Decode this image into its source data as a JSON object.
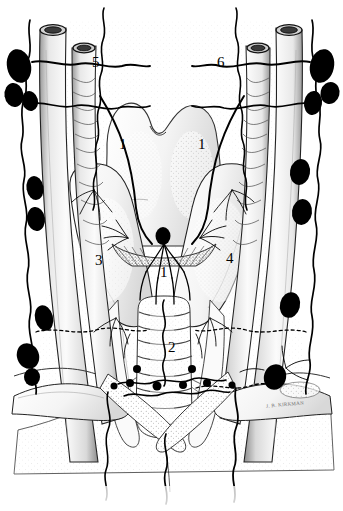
{
  "figure": {
    "width": 343,
    "height": 511,
    "background": "#ffffff",
    "ink": "#000000",
    "style": "black-and-white stipple line drawing"
  },
  "labels": [
    {
      "id": "label-1-left",
      "text": "1",
      "x": 119,
      "y": 137
    },
    {
      "id": "label-1-right",
      "text": "1",
      "x": 198,
      "y": 137
    },
    {
      "id": "label-5",
      "text": "5",
      "x": 92,
      "y": 55
    },
    {
      "id": "label-6",
      "text": "6",
      "x": 217,
      "y": 55
    },
    {
      "id": "label-3",
      "text": "3",
      "x": 95,
      "y": 253
    },
    {
      "id": "label-4",
      "text": "4",
      "x": 226,
      "y": 251
    },
    {
      "id": "label-1-center",
      "text": "1",
      "x": 160,
      "y": 265
    },
    {
      "id": "label-2",
      "text": "2",
      "x": 168,
      "y": 340
    }
  ],
  "signature": {
    "text": "J. B. KIRKMAN",
    "x": 266,
    "y": 402
  },
  "structures": [
    {
      "name": "thyroid-cartilage",
      "side": "midline"
    },
    {
      "name": "thyroid-gland-right-lobe",
      "side": "left-of-image"
    },
    {
      "name": "thyroid-gland-left-lobe",
      "side": "right-of-image"
    },
    {
      "name": "thyroid-isthmus",
      "side": "midline"
    },
    {
      "name": "trachea",
      "side": "midline"
    },
    {
      "name": "common-carotid-artery",
      "side": "bilateral"
    },
    {
      "name": "internal-jugular-vein",
      "side": "bilateral"
    },
    {
      "name": "subclavian-vessels",
      "side": "bilateral"
    },
    {
      "name": "prelaryngeal-delphian-node",
      "side": "midline"
    },
    {
      "name": "pretracheal-nodes",
      "side": "midline"
    },
    {
      "name": "deep-cervical-node-chain",
      "side": "bilateral"
    }
  ],
  "legend_key": {
    "1": "Lymphatic vessels of the thyroid gland",
    "2": "Pretracheal lymph nodes",
    "3": "Right lobe of thyroid gland",
    "4": "Left lobe of thyroid gland",
    "5": "Right lymphatic / jugular trunk",
    "6": "Left jugular lymphatic trunk"
  }
}
